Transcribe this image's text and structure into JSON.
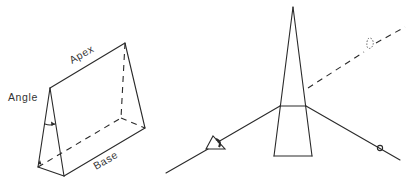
{
  "figure": {
    "left_panel": {
      "name": "prism-parts",
      "labels": {
        "apex": "Apex",
        "angle": "Angle",
        "base": "Base"
      }
    },
    "right_panel": {
      "name": "prism-light-deviation",
      "elements": [
        "prism",
        "incident-ray",
        "refracted-ray",
        "eye-symbol",
        "object-point",
        "virtual-image"
      ]
    },
    "colors": {
      "line": "#2a2a2a",
      "text": "#333333",
      "background": "#ffffff"
    }
  }
}
